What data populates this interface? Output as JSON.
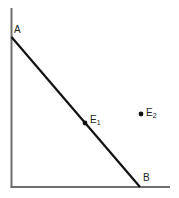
{
  "diagram": {
    "points": {
      "A": {
        "label": "A"
      },
      "B": {
        "label": "B"
      },
      "E1": {
        "label": "E",
        "sub": "1"
      },
      "E2": {
        "label": "E",
        "sub": "2"
      }
    },
    "colors": {
      "axis": "#6e6e6e",
      "line": "#111111",
      "point": "#111111"
    }
  }
}
